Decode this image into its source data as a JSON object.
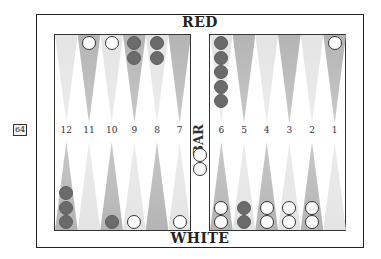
{
  "labels": {
    "top_player": "RED",
    "bottom_player": "WHITE",
    "bar": "BAR"
  },
  "cube": {
    "value": "64"
  },
  "point_numbers": {
    "left": [
      "12",
      "11",
      "10",
      "9",
      "8",
      "7"
    ],
    "right": [
      "6",
      "5",
      "4",
      "3",
      "2",
      "1"
    ]
  },
  "colors": {
    "red_checker": "#6b6b6b",
    "white_checker": "#ffffff",
    "dark_point": "#b4b4b4",
    "light_point": "#e4e4e4"
  },
  "position": {
    "top": [
      {
        "column": 12,
        "color": "",
        "count": 0
      },
      {
        "column": 11,
        "color": "white",
        "count": 1
      },
      {
        "column": 10,
        "color": "white",
        "count": 1
      },
      {
        "column": 9,
        "color": "red",
        "count": 2
      },
      {
        "column": 8,
        "color": "red",
        "count": 2
      },
      {
        "column": 7,
        "color": "",
        "count": 0
      },
      {
        "column": 6,
        "color": "red",
        "count": 5
      },
      {
        "column": 5,
        "color": "",
        "count": 0
      },
      {
        "column": 4,
        "color": "",
        "count": 0
      },
      {
        "column": 3,
        "color": "",
        "count": 0
      },
      {
        "column": 2,
        "color": "",
        "count": 0
      },
      {
        "column": 1,
        "color": "white",
        "count": 1
      }
    ],
    "bottom": [
      {
        "column": 12,
        "color": "red",
        "count": 3
      },
      {
        "column": 11,
        "color": "",
        "count": 0
      },
      {
        "column": 10,
        "color": "red",
        "count": 1
      },
      {
        "column": 9,
        "color": "white",
        "count": 1
      },
      {
        "column": 8,
        "color": "",
        "count": 0
      },
      {
        "column": 7,
        "color": "white",
        "count": 1
      },
      {
        "column": 6,
        "color": "white",
        "count": 2
      },
      {
        "column": 5,
        "color": "red",
        "count": 2
      },
      {
        "column": 4,
        "color": "white",
        "count": 2
      },
      {
        "column": 3,
        "color": "white",
        "count": 2
      },
      {
        "column": 2,
        "color": "white",
        "count": 2
      },
      {
        "column": 1,
        "color": "",
        "count": 0
      }
    ],
    "bar": {
      "white": 2,
      "red": 0
    }
  }
}
